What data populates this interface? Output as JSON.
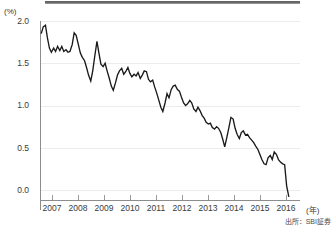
{
  "figure": {
    "y_unit_label": "(%)",
    "x_unit_label": "(年)",
    "source_note": "出所：SBI証券"
  },
  "chart_data": {
    "type": "line",
    "title": "",
    "xlabel": "(年)",
    "ylabel": "(%)",
    "xlim": [
      2006.4,
      2016.9
    ],
    "ylim": [
      -0.15,
      2.05
    ],
    "yticks": [
      0.0,
      0.5,
      1.0,
      1.5,
      2.0
    ],
    "ytick_labels": [
      "0.0",
      "0.5",
      "1.0",
      "1.5",
      "2.0"
    ],
    "xticks": [
      2007,
      2008,
      2009,
      2010,
      2011,
      2012,
      2013,
      2014,
      2015,
      2016
    ],
    "xtick_labels": [
      "2007",
      "2008",
      "2009",
      "2010",
      "2011",
      "2012",
      "2013",
      "2014",
      "2015",
      "2016"
    ],
    "grid": true,
    "grid_axis": "y",
    "legend": false,
    "line_color": "#1a1a1a",
    "series": [
      {
        "name": "yield",
        "x": [
          2006.45,
          2006.53,
          2006.62,
          2006.7,
          2006.78,
          2006.86,
          2006.95,
          2007.03,
          2007.11,
          2007.2,
          2007.28,
          2007.36,
          2007.45,
          2007.53,
          2007.61,
          2007.7,
          2007.78,
          2007.86,
          2007.95,
          2008.03,
          2008.11,
          2008.2,
          2008.28,
          2008.36,
          2008.45,
          2008.53,
          2008.61,
          2008.7,
          2008.78,
          2008.86,
          2008.95,
          2009.03,
          2009.11,
          2009.2,
          2009.28,
          2009.36,
          2009.45,
          2009.53,
          2009.61,
          2009.7,
          2009.78,
          2009.86,
          2009.95,
          2010.03,
          2010.11,
          2010.2,
          2010.28,
          2010.36,
          2010.45,
          2010.53,
          2010.61,
          2010.7,
          2010.78,
          2010.86,
          2010.95,
          2011.03,
          2011.11,
          2011.2,
          2011.28,
          2011.36,
          2011.45,
          2011.53,
          2011.61,
          2011.7,
          2011.78,
          2011.86,
          2011.95,
          2012.03,
          2012.11,
          2012.2,
          2012.28,
          2012.36,
          2012.45,
          2012.53,
          2012.61,
          2012.7,
          2012.78,
          2012.86,
          2012.95,
          2013.03,
          2013.11,
          2013.2,
          2013.28,
          2013.36,
          2013.45,
          2013.53,
          2013.61,
          2013.7,
          2013.78,
          2013.86,
          2013.95,
          2014.03,
          2014.11,
          2014.2,
          2014.28,
          2014.36,
          2014.45,
          2014.53,
          2014.61,
          2014.7,
          2014.78,
          2014.86,
          2014.95,
          2015.03,
          2015.11,
          2015.2,
          2015.28,
          2015.36,
          2015.45,
          2015.53,
          2015.61,
          2015.7,
          2015.78,
          2015.86,
          2015.95,
          2016.03,
          2016.11,
          2016.2,
          2016.28,
          2016.36,
          2016.45
        ],
        "values": [
          1.85,
          1.93,
          1.95,
          1.8,
          1.68,
          1.63,
          1.68,
          1.64,
          1.7,
          1.65,
          1.7,
          1.64,
          1.66,
          1.63,
          1.64,
          1.72,
          1.86,
          1.83,
          1.72,
          1.62,
          1.57,
          1.53,
          1.45,
          1.36,
          1.29,
          1.41,
          1.58,
          1.76,
          1.62,
          1.49,
          1.46,
          1.5,
          1.41,
          1.32,
          1.23,
          1.18,
          1.27,
          1.36,
          1.41,
          1.44,
          1.37,
          1.4,
          1.45,
          1.38,
          1.34,
          1.37,
          1.35,
          1.39,
          1.32,
          1.36,
          1.41,
          1.4,
          1.31,
          1.28,
          1.3,
          1.22,
          1.15,
          1.06,
          0.98,
          0.93,
          1.03,
          1.14,
          1.09,
          1.19,
          1.23,
          1.24,
          1.19,
          1.17,
          1.1,
          1.03,
          1.0,
          1.02,
          1.06,
          1.03,
          0.96,
          0.93,
          0.98,
          0.94,
          0.88,
          0.85,
          0.8,
          0.78,
          0.79,
          0.74,
          0.72,
          0.75,
          0.73,
          0.68,
          0.6,
          0.51,
          0.63,
          0.74,
          0.86,
          0.84,
          0.73,
          0.66,
          0.61,
          0.68,
          0.7,
          0.65,
          0.66,
          0.62,
          0.59,
          0.56,
          0.52,
          0.48,
          0.42,
          0.36,
          0.31,
          0.3,
          0.38,
          0.41,
          0.36,
          0.45,
          0.42,
          0.36,
          0.33,
          0.31,
          0.3,
          0.05,
          -0.08
        ]
      }
    ]
  }
}
